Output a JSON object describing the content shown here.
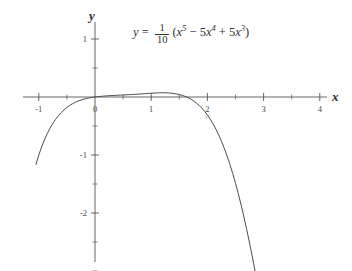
{
  "figure": {
    "equation": {
      "lhs": "y",
      "equals": "=",
      "numerator": "1",
      "denominator": "10",
      "body_open": "(",
      "term1_base": "x",
      "term1_exp": "5",
      "op1": "−",
      "term2_coef": "5",
      "term2_base": "x",
      "term2_exp": "4",
      "op2": "+",
      "term3_coef": "5",
      "term3_base": "x",
      "term3_exp": "3",
      "body_close": ")"
    },
    "x_axis_name": "x",
    "y_axis_name": "y",
    "stray_mark": "s"
  },
  "chart_data": {
    "type": "line",
    "title": "",
    "xlabel": "x",
    "ylabel": "y",
    "grid": false,
    "legend": null,
    "expression": "y = (1/10)(x^5 - 5x^4 + 5x^3)",
    "xlim": [
      -1.3,
      4.15
    ],
    "ylim": [
      -3.05,
      1.35
    ],
    "x_ticks_major": [
      -1,
      0,
      1,
      2,
      3,
      4
    ],
    "x_tick_labels": [
      "-1",
      "0",
      "1",
      "2",
      "3",
      "4"
    ],
    "x_ticks_minor": [
      -0.5,
      0.5,
      1.5,
      2.5,
      3.5
    ],
    "y_ticks_major": [
      1,
      -1,
      -2
    ],
    "y_tick_labels": [
      "1",
      "-1",
      "-2"
    ],
    "y_ticks_minor": [
      0.5,
      -0.5,
      -1.5,
      -2.5,
      -3
    ],
    "domain_drawn": [
      -1.05,
      3.78
    ],
    "series": [
      {
        "name": "y = (1/10)(x^5 - 5x^4 + 5x^3)",
        "color": "#4d4d4d",
        "x": [
          -1.05,
          -1.0,
          -0.95,
          -0.9,
          -0.85,
          -0.8,
          -0.75,
          -0.7,
          -0.65,
          -0.6,
          -0.55,
          -0.5,
          -0.45,
          -0.4,
          -0.35,
          -0.3,
          -0.25,
          -0.2,
          -0.15,
          -0.1,
          -0.05,
          0.0,
          0.05,
          0.1,
          0.15,
          0.2,
          0.25,
          0.3,
          0.35,
          0.4,
          0.45,
          0.5,
          0.55,
          0.6,
          0.65,
          0.7,
          0.75,
          0.8,
          0.85,
          0.9,
          0.95,
          1.0,
          1.05,
          1.1,
          1.15,
          1.2,
          1.25,
          1.3,
          1.35,
          1.4,
          1.45,
          1.5,
          1.55,
          1.6,
          1.65,
          1.7,
          1.75,
          1.8,
          1.85,
          1.9,
          1.95,
          2.0,
          2.05,
          2.1,
          2.15,
          2.2,
          2.25,
          2.3,
          2.35,
          2.4,
          2.45,
          2.5,
          2.55,
          2.6,
          2.65,
          2.7,
          2.75,
          2.8,
          2.85,
          2.9,
          2.95,
          3.0,
          3.05,
          3.1,
          3.15,
          3.2,
          3.25,
          3.3,
          3.35,
          3.4,
          3.45,
          3.5,
          3.55,
          3.6,
          3.65,
          3.7,
          3.75,
          3.78
        ],
        "y": [
          -1.162,
          -1.0,
          -0.861,
          -0.739,
          -0.632,
          -0.538,
          -0.456,
          -0.384,
          -0.322,
          -0.268,
          -0.221,
          -0.18,
          -0.146,
          -0.116,
          -0.091,
          -0.07,
          -0.053,
          -0.038,
          -0.026,
          -0.016,
          -0.008,
          0.0,
          0.006,
          0.011,
          0.015,
          0.019,
          0.022,
          0.025,
          0.028,
          0.03,
          0.033,
          0.035,
          0.038,
          0.04,
          0.043,
          0.045,
          0.048,
          0.051,
          0.055,
          0.058,
          0.062,
          0.065,
          0.068,
          0.07,
          0.072,
          0.073,
          0.072,
          0.07,
          0.066,
          0.06,
          0.052,
          0.042,
          0.029,
          0.012,
          -0.009,
          -0.034,
          -0.065,
          -0.101,
          -0.143,
          -0.191,
          -0.247,
          -0.31,
          -0.382,
          -0.462,
          -0.552,
          -0.651,
          -0.762,
          -0.883,
          -1.016,
          -1.161,
          -1.318,
          -1.487,
          -1.669,
          -1.863,
          -2.07,
          -2.288,
          -2.518,
          -2.758,
          -3.007,
          -3.264,
          -3.527,
          -3.795,
          -4.064,
          -4.331,
          -4.593,
          -4.845,
          -5.082,
          -5.298,
          -5.487,
          -5.641,
          -5.751,
          -5.807,
          -5.797,
          -5.708,
          -5.526,
          -5.233,
          -4.813,
          -4.469
        ],
        "visual_clip": true,
        "note": "curve is clipped by the plot frame at y = -3.05 and y = 1.35"
      }
    ],
    "features": {
      "local_max": {
        "x": 1.0,
        "y": 0.1
      },
      "local_min": {
        "x": 3.0,
        "y": -2.7
      },
      "roots_shown": [
        0.0,
        3.618
      ],
      "left_endpoint": {
        "x": -1.05,
        "y": -1.16
      }
    }
  }
}
